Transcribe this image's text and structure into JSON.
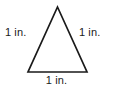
{
  "figure": {
    "name": "equilateral-triangle-with-side-lengths",
    "background_color": "#ffffff",
    "stroke_color": "#1a1a1a",
    "text_color": "#1a1a1a",
    "shape": {
      "type": "triangle",
      "vertices": {
        "apex": [
          57.5,
          7
        ],
        "bottom_left": [
          28,
          72
        ],
        "bottom_right": [
          87,
          72
        ]
      },
      "fill": "none",
      "stroke_width": 1.7
    },
    "labels": {
      "left": "1 in.",
      "right": "1 in.",
      "bottom": "1 in."
    }
  }
}
